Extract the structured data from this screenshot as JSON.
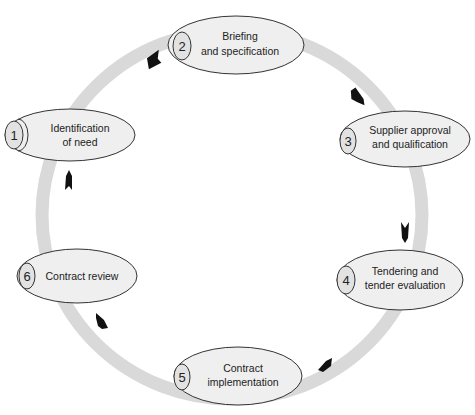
{
  "diagram": {
    "type": "cycle",
    "ring_color": "#d9d9d9",
    "node_fill": "#efefef",
    "node_stroke": "#333333",
    "arrow_color": "#111111",
    "nodes": [
      {
        "number": "1",
        "lines": [
          "Identification",
          "of need"
        ]
      },
      {
        "number": "2",
        "lines": [
          "Briefing",
          "and specification"
        ]
      },
      {
        "number": "3",
        "lines": [
          "Supplier approval",
          "and qualification"
        ]
      },
      {
        "number": "4",
        "lines": [
          "Tendering and",
          "tender evaluation"
        ]
      },
      {
        "number": "5",
        "lines": [
          "Contract",
          "implementation"
        ]
      },
      {
        "number": "6",
        "lines": [
          "Contract review"
        ]
      }
    ],
    "edges": [
      {
        "from": "1",
        "to": "2"
      },
      {
        "from": "2",
        "to": "3"
      },
      {
        "from": "3",
        "to": "4"
      },
      {
        "from": "4",
        "to": "5"
      },
      {
        "from": "5",
        "to": "6"
      },
      {
        "from": "6",
        "to": "1"
      }
    ]
  }
}
